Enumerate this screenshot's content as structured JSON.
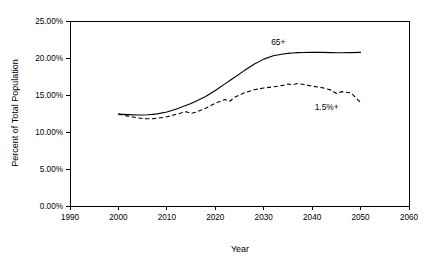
{
  "chart_data": {
    "type": "line",
    "title": "",
    "xlabel": "Year",
    "ylabel": "Percent of Total Population",
    "xlim": [
      1990,
      2060
    ],
    "ylim": [
      0,
      0.25
    ],
    "grid": false,
    "legend_position": "inline-annotations",
    "xticks": [
      1990,
      2000,
      2010,
      2020,
      2030,
      2040,
      2050,
      2060
    ],
    "xticklabels": [
      "1990",
      "2000",
      "2010",
      "2020",
      "2030",
      "2040",
      "2050",
      "2060"
    ],
    "yticks": [
      0.0,
      0.05,
      0.1,
      0.15,
      0.2,
      0.25
    ],
    "yticklabels": [
      "0.00%",
      "5.00%",
      "10.00%",
      "15.00%",
      "20.00%",
      "25.00%"
    ],
    "x": [
      2000,
      2002,
      2004,
      2005,
      2006,
      2007,
      2008,
      2010,
      2012,
      2014,
      2015,
      2016,
      2018,
      2020,
      2022,
      2023,
      2024,
      2026,
      2028,
      2030,
      2032,
      2034,
      2035,
      2036,
      2037,
      2038,
      2040,
      2042,
      2044,
      2045,
      2046,
      2048,
      2050
    ],
    "series": [
      {
        "name": "65+",
        "style": "solid",
        "label": "65+",
        "label_x": 2033,
        "label_y": 0.217,
        "values": [
          0.1242,
          0.1235,
          0.123,
          0.123,
          0.1233,
          0.1238,
          0.1245,
          0.127,
          0.131,
          0.136,
          0.1385,
          0.1415,
          0.148,
          0.156,
          0.165,
          0.1695,
          0.174,
          0.183,
          0.1915,
          0.1985,
          0.203,
          0.2055,
          0.2062,
          0.2068,
          0.2072,
          0.2075,
          0.2078,
          0.2076,
          0.2072,
          0.2071,
          0.207,
          0.2072,
          0.2076
        ]
      },
      {
        "name": "1.5%+",
        "style": "dashed",
        "label": "1.5%+",
        "label_x": 2043,
        "label_y": 0.1295,
        "values": [
          0.1242,
          0.1215,
          0.119,
          0.1182,
          0.118,
          0.118,
          0.1185,
          0.1205,
          0.124,
          0.1275,
          0.125,
          0.1268,
          0.132,
          0.139,
          0.144,
          0.1415,
          0.147,
          0.153,
          0.157,
          0.1595,
          0.161,
          0.163,
          0.1648,
          0.164,
          0.1655,
          0.1645,
          0.162,
          0.16,
          0.1565,
          0.152,
          0.1545,
          0.153,
          0.14
        ]
      }
    ]
  },
  "accent_color": "#000000"
}
